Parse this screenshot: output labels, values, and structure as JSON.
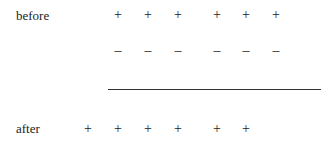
{
  "rows": [
    {
      "label": "before",
      "plus_cols": [
        1,
        2,
        3,
        4,
        5,
        6
      ],
      "minus_cols": [
        1,
        2,
        3,
        4,
        5,
        6
      ]
    },
    {
      "label": "after",
      "plus_cols": [
        0,
        1,
        2,
        3,
        4,
        5
      ],
      "minus_cols": [
        2,
        3,
        4,
        5,
        6,
        7
      ]
    }
  ],
  "symbols": {
    "plus": "+",
    "minus": "–"
  },
  "labels": {
    "before": "before",
    "after": "after"
  }
}
